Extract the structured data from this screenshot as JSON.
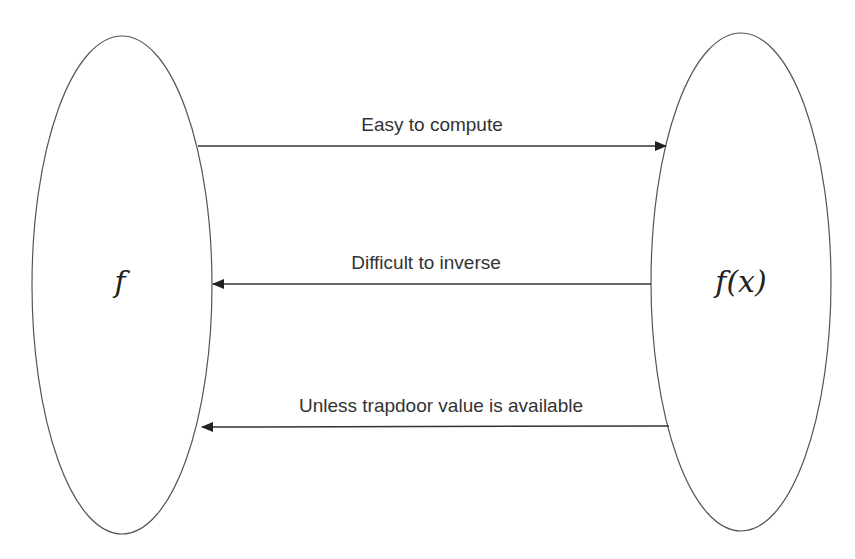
{
  "diagram": {
    "left_node": {
      "label": "f"
    },
    "right_node": {
      "label": "f(x)"
    },
    "arrows": [
      {
        "label": "Easy to compute",
        "direction": "left-to-right"
      },
      {
        "label": "Difficult to inverse",
        "direction": "right-to-left"
      },
      {
        "label": "Unless trapdoor value is available",
        "direction": "right-to-left"
      }
    ]
  }
}
